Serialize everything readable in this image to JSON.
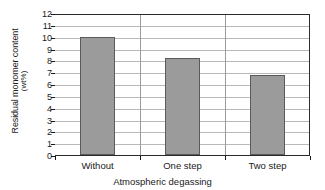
{
  "chart_data": {
    "type": "bar",
    "title": "",
    "categories": [
      "Without",
      "One step",
      "Two step"
    ],
    "values": [
      10.0,
      8.2,
      6.8
    ],
    "xlabel": "Atmospheric degassing",
    "ylabel": "Residual monomer content",
    "ylabel_unit": "(wt%)",
    "ylim": [
      0,
      12
    ],
    "ytick_labels": [
      "0",
      "1",
      "2",
      "3",
      "4",
      "5",
      "6",
      "7",
      "8",
      "9",
      "10",
      "11",
      "12"
    ],
    "ytick_values": [
      0,
      1,
      2,
      3,
      4,
      5,
      6,
      7,
      8,
      9,
      10,
      11,
      12
    ],
    "grid": true,
    "legend": "none",
    "bar_color": "#9b9b9b",
    "bar_edge_color": "#5a5a5a",
    "grid_color": "#b9b9b9",
    "axis_color": "#1a1a1a"
  }
}
